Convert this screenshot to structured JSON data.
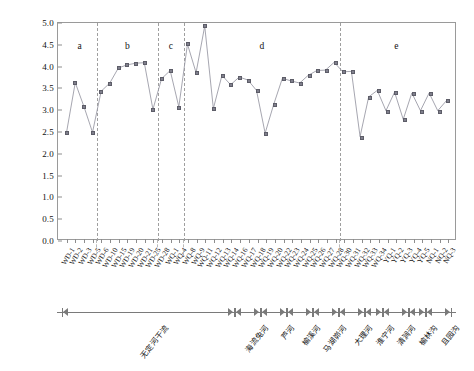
{
  "chart_data": {
    "type": "line",
    "title": "",
    "xlabel": "",
    "ylabel": "Shannon-Wiener多样性指数",
    "ylim": [
      0.0,
      5.0
    ],
    "ytick_labels": [
      "0.0",
      "0.5",
      "1.0",
      "1.5",
      "2.0",
      "2.5",
      "3.0",
      "3.5",
      "4.0",
      "4.5",
      "5.0"
    ],
    "ytick_values": [
      0.0,
      0.5,
      1.0,
      1.5,
      2.0,
      2.5,
      3.0,
      3.5,
      4.0,
      4.5,
      5.0
    ],
    "grid": false,
    "legend": "none",
    "marker": "square",
    "series_color": "#7f7f8c",
    "line_color": "#9b9ba6",
    "categories": [
      "WD-1",
      "WD-2",
      "WD-3",
      "WD-5",
      "WD-6",
      "WD-10",
      "WD-15",
      "WD-19",
      "WD-20",
      "WD-21",
      "WD-25",
      "WD-28",
      "WQ-1",
      "WQ-4",
      "WQ-8",
      "WQ-9",
      "WQ-11",
      "WQ-12",
      "WQ-13",
      "WQ-14",
      "WQ-16",
      "WQ-17",
      "WQ-18",
      "WQ-19",
      "WQ-20",
      "WQ-22",
      "WQ-23",
      "WQ-24",
      "WQ-25",
      "WQ-26",
      "WQ-27",
      "WQ-28",
      "WQ-30",
      "WQ-31",
      "WQ-32",
      "WQ-33",
      "WQ-34",
      "YQ-1",
      "YQ-2",
      "YQ-3",
      "YQ-4",
      "YQ-5",
      "NQ-1",
      "NQ-2",
      "NQ-3"
    ],
    "values": [
      2.48,
      3.62,
      3.07,
      2.47,
      3.42,
      3.61,
      3.96,
      4.03,
      4.07,
      4.08,
      3.0,
      3.71,
      3.9,
      3.06,
      4.51,
      3.85,
      4.93,
      3.02,
      3.79,
      3.57,
      3.75,
      3.68,
      3.44,
      2.45,
      3.12,
      3.72,
      3.66,
      3.61,
      3.79,
      3.9,
      3.91,
      4.09,
      3.87,
      3.88,
      2.37,
      3.29,
      3.44,
      2.97,
      3.4,
      2.77,
      3.38,
      2.97,
      3.38,
      2.97,
      3.2
    ],
    "groups": [
      {
        "label": "a",
        "start_index": 0,
        "end_index": 3
      },
      {
        "label": "b",
        "start_index": 4,
        "end_index": 10
      },
      {
        "label": "c",
        "start_index": 11,
        "end_index": 13
      },
      {
        "label": "d",
        "start_index": 14,
        "end_index": 31
      },
      {
        "label": "e",
        "start_index": 32,
        "end_index": 44
      }
    ],
    "group_separators_after_index": [
      3,
      10,
      13,
      31
    ],
    "river_sections": [
      {
        "label": "无定河干流",
        "start_index": 0,
        "end_index": 19
      },
      {
        "label": "海流兔河",
        "start_index": 20,
        "end_index": 22
      },
      {
        "label": "芦河",
        "start_index": 23,
        "end_index": 25
      },
      {
        "label": "榆溪河",
        "start_index": 26,
        "end_index": 28
      },
      {
        "label": "马湖峁河",
        "start_index": 29,
        "end_index": 31
      },
      {
        "label": "大理河",
        "start_index": 32,
        "end_index": 34
      },
      {
        "label": "淮宁河",
        "start_index": 35,
        "end_index": 36
      },
      {
        "label": "清涧河",
        "start_index": 37,
        "end_index": 39
      },
      {
        "label": "榆林沟",
        "start_index": 40,
        "end_index": 41
      },
      {
        "label": "且园沟",
        "start_index": 42,
        "end_index": 44
      }
    ]
  }
}
